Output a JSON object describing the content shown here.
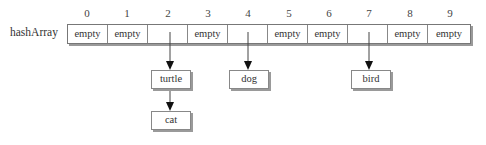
{
  "diagram": {
    "array_label": "hashArray",
    "indices": [
      "0",
      "1",
      "2",
      "3",
      "4",
      "5",
      "6",
      "7",
      "8",
      "9"
    ],
    "cells": [
      "empty",
      "empty",
      "",
      "empty",
      "",
      "empty",
      "empty",
      "",
      "empty",
      "empty"
    ],
    "chains": [
      {
        "index": 2,
        "nodes": [
          "turtle",
          "cat"
        ]
      },
      {
        "index": 4,
        "nodes": [
          "dog"
        ]
      },
      {
        "index": 7,
        "nodes": [
          "bird"
        ]
      }
    ],
    "nodes": {
      "turtle": "turtle",
      "cat": "cat",
      "dog": "dog",
      "bird": "bird"
    }
  }
}
